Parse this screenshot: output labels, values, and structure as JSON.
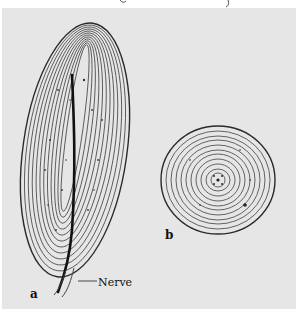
{
  "figure": {
    "labels": {
      "a": "a",
      "b": "b",
      "nerve": "Nerve"
    },
    "colors": {
      "background": "#e6e6e6",
      "page": "#ffffff",
      "ink": "#1a1a1a"
    }
  }
}
